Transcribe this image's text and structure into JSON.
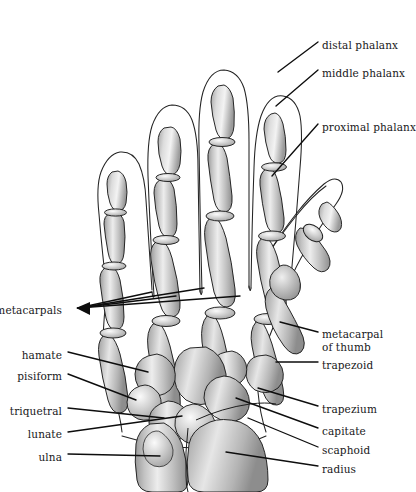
{
  "figure": {
    "title_fragment": "",
    "view": "dorsal view of right hand",
    "colors": {
      "bone_fill": "#b9b9b9",
      "bone_fill_light": "#d9d9d9",
      "bone_highlight": "#f2f2f2",
      "bone_outline": "#1d1d1d",
      "skin_outline": "#242424",
      "leader_line": "#0d0d0d",
      "background": "#ffffff",
      "label_text": "#18181a"
    }
  },
  "labels": {
    "right": [
      {
        "id": "distal-phalanx",
        "text": "distal phalanx",
        "x": 322,
        "y": 39
      },
      {
        "id": "middle-phalanx",
        "text": "middle phalanx",
        "x": 322,
        "y": 67
      },
      {
        "id": "proximal-phalanx",
        "text": "proximal phalanx",
        "x": 322,
        "y": 121
      },
      {
        "id": "metacarpal-of-thumb-line1",
        "text": "metacarpal",
        "x": 322,
        "y": 328
      },
      {
        "id": "metacarpal-of-thumb-line2",
        "text": "of thumb",
        "x": 322,
        "y": 341
      },
      {
        "id": "trapezoid",
        "text": "trapezoid",
        "x": 322,
        "y": 359
      },
      {
        "id": "trapezium",
        "text": "trapezium",
        "x": 322,
        "y": 403
      },
      {
        "id": "capitate",
        "text": "capitate",
        "x": 322,
        "y": 425
      },
      {
        "id": "scaphoid",
        "text": "scaphoid",
        "x": 322,
        "y": 444
      },
      {
        "id": "radius",
        "text": "radius",
        "x": 322,
        "y": 463
      }
    ],
    "left": [
      {
        "id": "metacarpals",
        "text": "metacarpals",
        "right": 343,
        "y": 304
      },
      {
        "id": "hamate",
        "text": "hamate",
        "right": 343,
        "y": 349
      },
      {
        "id": "pisiform",
        "text": "pisiform",
        "right": 343,
        "y": 370
      },
      {
        "id": "triquetral",
        "text": "triquetral",
        "right": 343,
        "y": 405
      },
      {
        "id": "lunate",
        "text": "lunate",
        "right": 343,
        "y": 428
      },
      {
        "id": "ulna",
        "text": "ulna",
        "right": 343,
        "y": 451
      }
    ]
  },
  "bone_groups": {
    "phalanges": "14 finger and thumb phalanges",
    "metacarpals": "5 metacarpal bones",
    "carpals": [
      "scaphoid",
      "lunate",
      "triquetral",
      "pisiform",
      "trapezium",
      "trapezoid",
      "capitate",
      "hamate"
    ],
    "forearm": [
      "radius",
      "ulna"
    ]
  }
}
